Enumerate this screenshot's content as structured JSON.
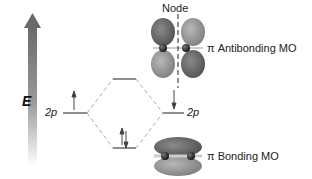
{
  "diagram": {
    "type": "molecular orbital energy diagram",
    "axis": {
      "label": "E"
    },
    "left_atomic_orbital": {
      "label": "2p",
      "electrons": 1
    },
    "right_atomic_orbital": {
      "label": "2p",
      "electrons": 1
    },
    "molecular_orbitals": [
      {
        "name": "antibonding",
        "label": "π Antibonding MO",
        "electrons": 0,
        "node_label": "Node"
      },
      {
        "name": "bonding",
        "label": "π Bonding MO",
        "electrons": 2
      }
    ],
    "colors": {
      "lobe_dark": "#6e6e6e",
      "lobe_light": "#a8a8a8",
      "line": "#444444",
      "dashed": "#aaaaaa",
      "arrow_top": "#6a6a6a"
    }
  }
}
